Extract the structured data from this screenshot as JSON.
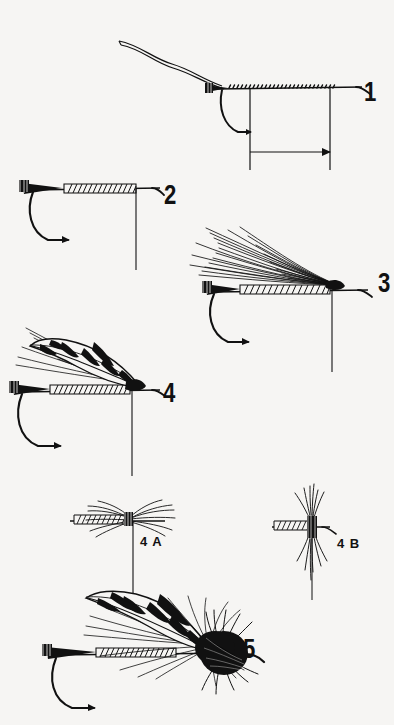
{
  "figure": {
    "style": "black line art on off-white paper",
    "background_color": "#f6f5f3",
    "ink_color": "#111111"
  },
  "labels": {
    "step1": "1",
    "step2": "2",
    "step3": "3",
    "step4": "4",
    "step5": "5",
    "detail_4a": "4 A",
    "detail_4b": "4 B"
  },
  "steps": [
    {
      "id": "1",
      "label": "1",
      "caption": "Hook in vise with tying thread wound along the shank; loose thread tag curving up and to the left, tail tag at the bend, with two vertical reference lines and a horizontal dimension arrow marking the body length."
    },
    {
      "id": "2",
      "label": "2",
      "caption": "Ribbed body formed over the shank with a single vertical reference line at the front."
    },
    {
      "id": "3",
      "label": "3",
      "caption": "Hair fibers tied in at the head and swept back over the ribbed body as an underwing."
    },
    {
      "id": "4",
      "label": "4",
      "caption": "Mottled barred feather wing laid over the hair underwing along the ribbed body."
    },
    {
      "id": "4A",
      "label": "4 A",
      "caption": "Top view detail: fibers splayed horizontally to each side of the shank at the tie-in point."
    },
    {
      "id": "4B",
      "label": "4 B",
      "caption": "Front view detail: fibers flaring vertically above and below the shank at the tie-in point."
    },
    {
      "id": "5",
      "label": "5",
      "caption": "Finished fly with dense hackle collar and head at the eye."
    }
  ]
}
